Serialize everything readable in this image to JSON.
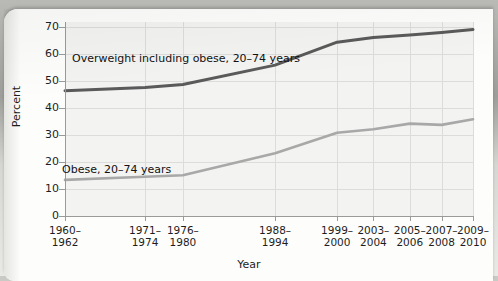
{
  "figure": {
    "media": "scanned textbook page",
    "xtitle": "Year",
    "ytitle": "Percent"
  },
  "chart_data": {
    "type": "line",
    "title": "",
    "xlabel": "Year",
    "ylabel": "Percent",
    "ylim": [
      0,
      72
    ],
    "yticks": [
      0,
      10,
      20,
      30,
      40,
      50,
      60,
      70
    ],
    "grid": true,
    "legend_position": "inline-annotation",
    "categories": [
      "1960-\n1962",
      "1971-\n1974",
      "1976-\n1980",
      "1988-\n1994",
      "1999-\n2000",
      "2003-\n2004",
      "2005-\n2006",
      "2007-\n2008",
      "2009-\n2010"
    ],
    "category_lines": [
      [
        "1960–",
        "1962"
      ],
      [
        "1971–",
        "1974"
      ],
      [
        "1976–",
        "1980"
      ],
      [
        "1988–",
        "1994"
      ],
      [
        "1999–",
        "2000"
      ],
      [
        "2003–",
        "2004"
      ],
      [
        "2005–",
        "2006"
      ],
      [
        "2007–",
        "2008"
      ],
      [
        "2009–",
        "2010"
      ]
    ],
    "x_positions_frac": [
      0.0,
      0.196,
      0.289,
      0.515,
      0.667,
      0.756,
      0.845,
      0.923,
      1.0
    ],
    "series": [
      {
        "name": "Overweight including obese, 20–74 years",
        "color": "#5a5a5a",
        "values": [
          46.5,
          47.7,
          48.8,
          56.0,
          64.5,
          66.3,
          67.2,
          68.1,
          69.2
        ]
      },
      {
        "name": "Obese, 20–74 years",
        "color": "#a8a8a8",
        "values": [
          13.4,
          14.6,
          15.1,
          23.3,
          30.9,
          32.2,
          34.3,
          33.8,
          35.9
        ]
      }
    ],
    "annotations": [
      {
        "id": "overweight",
        "text_lines": [
          "Overweight including obese,",
          "20–74 years"
        ]
      },
      {
        "id": "obese",
        "text_lines": [
          "Obese, 20–74 years"
        ]
      }
    ]
  }
}
